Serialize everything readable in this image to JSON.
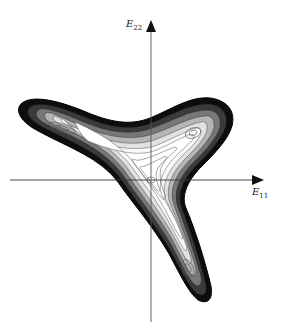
{
  "figure": {
    "type": "contour-plot",
    "axes": {
      "x": {
        "label_main": "E",
        "label_sub": "11"
      },
      "y": {
        "label_main": "E",
        "label_sub": "22"
      }
    },
    "colors": {
      "background": "#ffffff",
      "axis": "#333333",
      "contour": "#111111",
      "contour_light": "#555555"
    },
    "features": {
      "lobes": [
        "left",
        "upper-right",
        "lower"
      ],
      "center_minimum": "origin",
      "wells": 3
    }
  }
}
